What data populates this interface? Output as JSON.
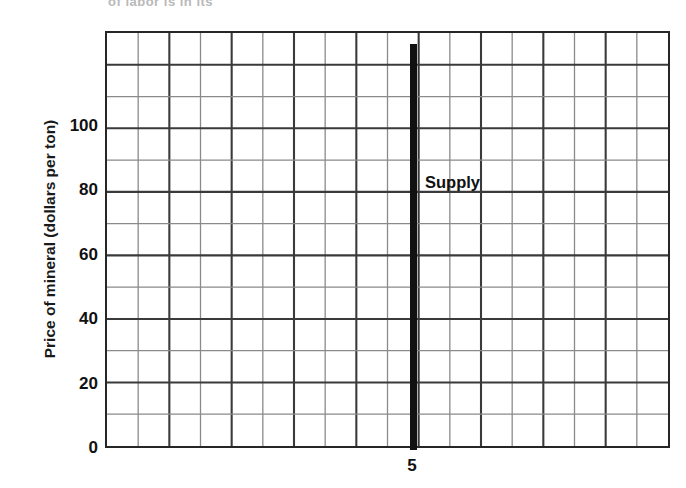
{
  "chart_data": {
    "type": "line",
    "title": "",
    "xlabel": "",
    "ylabel": "Price of mineral (dollars per ton)",
    "xlim": [
      0,
      9
    ],
    "ylim": [
      0,
      130
    ],
    "grid": true,
    "grid_columns": 18,
    "grid_rows": 13,
    "legend_position": "inline-annotation",
    "x_tick_labels": [
      "5"
    ],
    "x_tick_values": [
      5
    ],
    "y_tick_labels": [
      "0",
      "20",
      "40",
      "60",
      "80",
      "100"
    ],
    "y_tick_values": [
      0,
      20,
      40,
      60,
      80,
      100
    ],
    "series": [
      {
        "name": "Supply",
        "type": "vertical-line",
        "description": "Perfectly inelastic (vertical) supply curve at quantity 5",
        "x": 5,
        "y_start": 0,
        "y_end": 126,
        "color": "#111111",
        "annotation": "Supply",
        "annotation_x": 5.6,
        "annotation_y": 84
      }
    ]
  },
  "axes": {
    "y_title": "Price of mineral (dollars per ton)",
    "y_ticks": [
      {
        "label": "100",
        "value": 100
      },
      {
        "label": "80",
        "value": 80
      },
      {
        "label": "60",
        "value": 60
      },
      {
        "label": "40",
        "value": 40
      },
      {
        "label": "20",
        "value": 20
      },
      {
        "label": "0",
        "value": 0
      }
    ],
    "x_ticks": [
      {
        "label": "5",
        "value": 5
      }
    ]
  },
  "annotations": {
    "supply_label": "Supply",
    "top_clipped_text": "of labor is                in its"
  },
  "colors": {
    "axis": "#262626",
    "grid_major": "#3a3a3a",
    "grid_minor": "#8a8a8a",
    "series": "#111111",
    "text": "#111111",
    "background": "#ffffff"
  }
}
